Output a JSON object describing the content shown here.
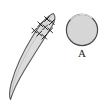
{
  "figure": {
    "background_color": "#ffffff",
    "width": 104,
    "height": 108,
    "caption": "",
    "objects": [
      {
        "name": "elongated-specimen",
        "kind": "lanceolate-spindle-outline",
        "fill_color": "#dcdcdc",
        "stroke_color": "#5a5a5a",
        "orientation": "diagonal bottom-left to top-right",
        "tip_top": [
          53,
          13
        ],
        "tip_bottom": [
          10,
          100
        ],
        "max_width": 14
      },
      {
        "name": "cross-section-disc",
        "kind": "filled-circle",
        "fill_color": "#d6d6d6",
        "stroke_color": "#4a4a4a",
        "center": [
          82,
          30
        ],
        "radius": 16,
        "label": "A"
      }
    ],
    "marks": {
      "name": "x-marks-cluster",
      "glyph": "×",
      "color": "#1a1a1a",
      "count": 8,
      "description": "cluster of small x marks on upper portion of specimen",
      "positions": [
        [
          47,
          19
        ],
        [
          52,
          22
        ],
        [
          40,
          24
        ],
        [
          45,
          27
        ],
        [
          50,
          30
        ],
        [
          34,
          30
        ],
        [
          39,
          33
        ],
        [
          44,
          36
        ]
      ]
    },
    "labels": {
      "a": "A"
    }
  }
}
